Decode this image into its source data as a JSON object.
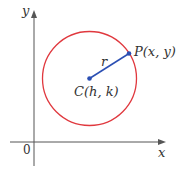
{
  "diagram": {
    "axes": {
      "x_label": "x",
      "y_label": "y",
      "origin_label": "0"
    },
    "circle": {
      "color": "#e0383e"
    },
    "radius": {
      "label": "r",
      "color": "#2b4fb3"
    },
    "center": {
      "label": "C(h, k)"
    },
    "point": {
      "label": "P(x, y)"
    }
  }
}
